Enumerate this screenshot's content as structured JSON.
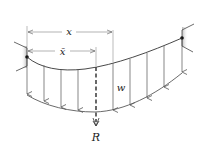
{
  "diagram": {
    "labels": {
      "x": "x",
      "x_bar": "x̄",
      "w": "w",
      "R": "R"
    },
    "colors": {
      "line": "#333333",
      "arrow": "#555555",
      "support_shade": "#c8c8c8",
      "dot": "#111111"
    },
    "supports": [
      {
        "name": "left-support",
        "pin": [
          27,
          57
        ]
      },
      {
        "name": "right-support",
        "pin": [
          182,
          38
        ]
      }
    ],
    "load_arrows_x": [
      27,
      44,
      61,
      78,
      113,
      130,
      147,
      164,
      182
    ],
    "resultant": {
      "x": 96,
      "top": 66,
      "bottom": 125
    }
  }
}
